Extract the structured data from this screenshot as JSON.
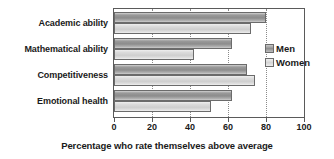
{
  "chart_data": {
    "type": "bar",
    "orientation": "horizontal",
    "title": "",
    "xlabel": "Percentage who rate themselves above average",
    "ylabel": "",
    "categories": [
      "Academic ability",
      "Mathematical ability",
      "Competitiveness",
      "Emotional health"
    ],
    "series": [
      {
        "name": "Men",
        "values": [
          80,
          62,
          70,
          62
        ]
      },
      {
        "name": "Women",
        "values": [
          72,
          42,
          74,
          51
        ]
      }
    ],
    "xlim": [
      0,
      100
    ],
    "xticks": [
      0,
      20,
      40,
      60,
      80,
      100
    ],
    "xtick_labels": [
      "0",
      "20",
      "40",
      "60",
      "80",
      "100"
    ],
    "grid": "vertical-dotted",
    "legend_position": "right-upper",
    "colors": {
      "men": "#8c8c8c",
      "women": "#d8d8d8",
      "axis": "#5a5a5a",
      "grid": "#8a8a8a",
      "text": "#1a1a1a",
      "background": "#ffffff"
    }
  },
  "axis": {
    "title": "Percentage who rate themselves above average"
  },
  "legend": {
    "items": [
      {
        "label": "Men",
        "swatch": "men-swatch"
      },
      {
        "label": "Women",
        "swatch": "women-swatch"
      }
    ]
  }
}
